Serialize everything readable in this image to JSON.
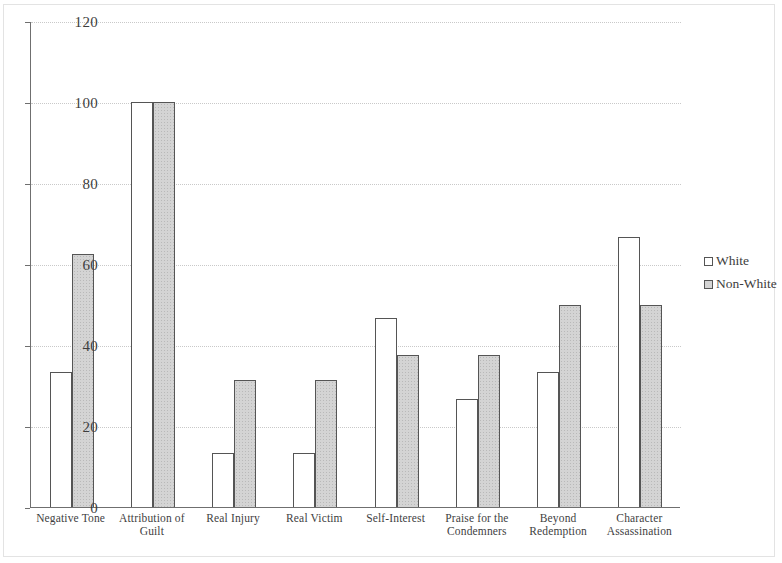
{
  "chart_data": {
    "type": "bar",
    "title": "",
    "xlabel": "",
    "ylabel": "",
    "ylim": [
      0,
      120
    ],
    "yticks": [
      0,
      20,
      40,
      60,
      80,
      100,
      120
    ],
    "grid": true,
    "legend_position": "right",
    "categories": [
      "Negative Tone",
      "Attribution of Guilt",
      "Real Injury",
      "Real Victim",
      "Self-Interest",
      "Praise for the Condemners",
      "Beyond Redemption",
      "Character Assassination"
    ],
    "category_lines": [
      [
        "Negative Tone"
      ],
      [
        "Attribution of",
        "Guilt"
      ],
      [
        "Real Injury"
      ],
      [
        "Real Victim"
      ],
      [
        "Self-Interest"
      ],
      [
        "Praise for the",
        "Condemners"
      ],
      [
        "Beyond",
        "Redemption"
      ],
      [
        "Character",
        "Assassination"
      ]
    ],
    "series": [
      {
        "name": "White",
        "color": "#ffffff",
        "values": [
          33.3,
          100,
          13.3,
          13.3,
          46.7,
          26.7,
          33.3,
          66.7
        ]
      },
      {
        "name": "Non-White",
        "color": "#d4d4d4",
        "values": [
          62.5,
          100,
          31.3,
          31.3,
          37.5,
          37.5,
          50,
          50
        ]
      }
    ]
  },
  "axis": {
    "tick_labels": [
      "120",
      "100",
      "80",
      "60",
      "40",
      "20",
      "0"
    ]
  },
  "legend": {
    "items": [
      {
        "label": "White",
        "swatch": "white"
      },
      {
        "label": "Non-White",
        "swatch": "nonwhite"
      }
    ]
  }
}
